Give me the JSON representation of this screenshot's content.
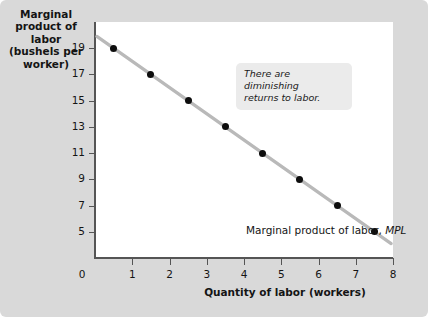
{
  "figure": {
    "background_color": "#d9d9d9",
    "panel_color": "#ffffff"
  },
  "axes": {
    "y_label": {
      "line1": "Marginal",
      "line2": "product of labor",
      "line3": "(bushels per",
      "line4": "worker)"
    },
    "x_label": "Quantity of labor (workers)",
    "origin_label": "0"
  },
  "annotation": {
    "line1": "There are diminishing",
    "line2": "returns to labor."
  },
  "curve_label": {
    "text": "Marginal product of labor,",
    "symbol": "MPL"
  },
  "chart_data": {
    "type": "line",
    "title": "",
    "xlabel": "Quantity of labor (workers)",
    "ylabel": "Marginal product of labor (bushels per worker)",
    "xlim": [
      0,
      8
    ],
    "ylim": [
      3,
      21
    ],
    "xticks": [
      0,
      1,
      2,
      3,
      4,
      5,
      6,
      7,
      8
    ],
    "xtick_labels": [
      "0",
      "1",
      "2",
      "3",
      "4",
      "5",
      "6",
      "7",
      "8"
    ],
    "yticks": [
      5,
      7,
      9,
      11,
      13,
      15,
      17,
      19
    ],
    "ytick_labels": [
      "5",
      "7",
      "9",
      "11",
      "13",
      "15",
      "17",
      "19"
    ],
    "grid": false,
    "legend": "none",
    "series": [
      {
        "name": "Marginal product of labor, MPL",
        "line_color": "#b9b9b9",
        "marker_color": "#0d0d0d",
        "x": [
          0.5,
          1.5,
          2.5,
          3.5,
          4.5,
          5.5,
          6.5,
          7.5
        ],
        "values": [
          19,
          17,
          15,
          13,
          11,
          9,
          7,
          5
        ]
      }
    ],
    "annotations": [
      {
        "text": "There are diminishing returns to labor.",
        "x": 3.6,
        "y": 20
      },
      {
        "text": "Marginal product of labor, MPL",
        "x": 4.1,
        "y": 5.9
      }
    ]
  }
}
